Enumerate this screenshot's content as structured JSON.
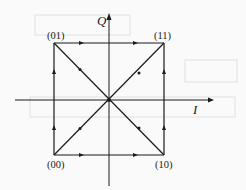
{
  "diagram": {
    "type": "QPSK state-transition diagram",
    "axes": {
      "horizontal_label": "I",
      "vertical_label": "Q"
    },
    "points": [
      {
        "id": "p01",
        "label": "(01)",
        "quadrant": "top-left"
      },
      {
        "id": "p11",
        "label": "(11)",
        "quadrant": "top-right"
      },
      {
        "id": "p00",
        "label": "(00)",
        "quadrant": "bottom-left"
      },
      {
        "id": "p10",
        "label": "(10)",
        "quadrant": "bottom-right"
      }
    ],
    "edges": [
      {
        "from": "(01)",
        "to": "(11)",
        "kind": "side"
      },
      {
        "from": "(00)",
        "to": "(10)",
        "kind": "side"
      },
      {
        "from": "(00)",
        "to": "(01)",
        "kind": "side"
      },
      {
        "from": "(10)",
        "to": "(11)",
        "kind": "side"
      },
      {
        "from": "(01)",
        "to": "(10)",
        "kind": "diagonal"
      },
      {
        "from": "(00)",
        "to": "(11)",
        "kind": "diagonal"
      }
    ],
    "colors": {
      "line": "#1a1a1a",
      "background": "#fafafa"
    }
  }
}
